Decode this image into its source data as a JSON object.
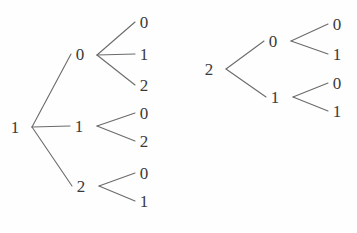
{
  "figure": {
    "kind": "tree-diagram",
    "background_color": "#fefefe",
    "edge_color": "#6b6b6b",
    "label_color": "#3a3a3a",
    "width": 357,
    "height": 233
  },
  "trees": [
    {
      "id": "left-tree",
      "root": {
        "label": "1",
        "x": 15,
        "y": 127
      },
      "branch_point": {
        "x": 32,
        "y": 127
      },
      "children": [
        {
          "label": "0",
          "x": 80,
          "y": 54,
          "branch_point": {
            "x": 97,
            "y": 55
          },
          "leaves": [
            {
              "label": "0",
              "x": 144,
              "y": 22
            },
            {
              "label": "1",
              "x": 144,
              "y": 54
            },
            {
              "label": "2",
              "x": 144,
              "y": 85
            }
          ]
        },
        {
          "label": "1",
          "x": 79,
          "y": 126,
          "branch_point": {
            "x": 97,
            "y": 126
          },
          "leaves": [
            {
              "label": "0",
              "x": 144,
              "y": 113
            },
            {
              "label": "2",
              "x": 144,
              "y": 141
            }
          ]
        },
        {
          "label": "2",
          "x": 81,
          "y": 186,
          "branch_point": {
            "x": 99,
            "y": 186
          },
          "leaves": [
            {
              "label": "0",
              "x": 144,
              "y": 173
            },
            {
              "label": "1",
              "x": 144,
              "y": 201
            }
          ]
        }
      ]
    },
    {
      "id": "right-tree",
      "root": {
        "label": "2",
        "x": 209,
        "y": 69
      },
      "branch_point": {
        "x": 226,
        "y": 69
      },
      "children": [
        {
          "label": "0",
          "x": 273,
          "y": 41,
          "branch_point": {
            "x": 291,
            "y": 41
          },
          "leaves": [
            {
              "label": "0",
              "x": 337,
              "y": 24
            },
            {
              "label": "1",
              "x": 337,
              "y": 54
            }
          ]
        },
        {
          "label": "1",
          "x": 275,
          "y": 97,
          "branch_point": {
            "x": 293,
            "y": 97
          },
          "leaves": [
            {
              "label": "0",
              "x": 337,
              "y": 83
            },
            {
              "label": "1",
              "x": 337,
              "y": 111
            }
          ]
        }
      ]
    }
  ]
}
